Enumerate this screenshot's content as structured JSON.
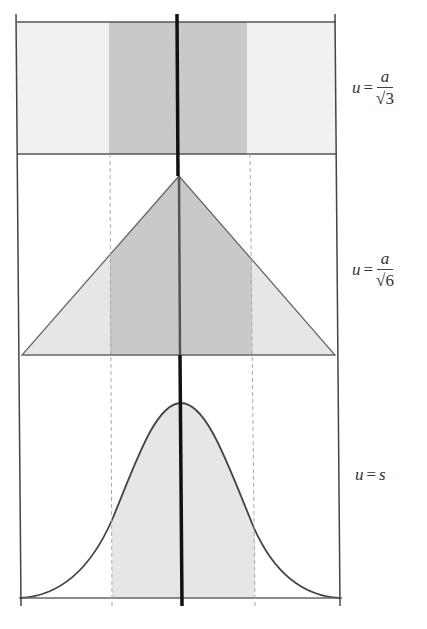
{
  "figure": {
    "colors": {
      "frame": "#555555",
      "center_line": "#111111",
      "dark_fill": "#c9c9c9",
      "light_fill": "#e6e6e6",
      "dashed": "#aaaaaa"
    },
    "panels": [
      {
        "id": "rectangular",
        "shape": "rectangle",
        "label": {
          "lhs": "u",
          "eq": "=",
          "num": "a",
          "den_radical": "√",
          "den_value": "3"
        }
      },
      {
        "id": "triangular",
        "shape": "triangle",
        "label": {
          "lhs": "u",
          "eq": "=",
          "num": "a",
          "den_radical": "√",
          "den_value": "6"
        }
      },
      {
        "id": "normal",
        "shape": "bell-curve",
        "label": {
          "lhs": "u",
          "eq": "=",
          "rhs": "s"
        }
      }
    ]
  }
}
